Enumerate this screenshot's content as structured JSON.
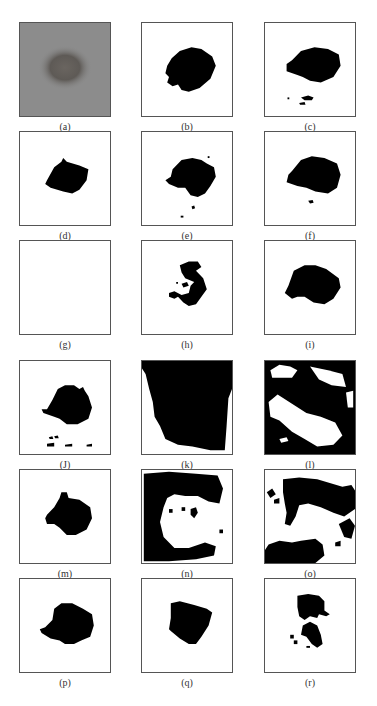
{
  "figure": {
    "colors": {
      "frame": "#555555",
      "mask": "#000000",
      "background": "#ffffff",
      "photo_bg": "#8c8c8c",
      "lesion": "#5e5a56"
    },
    "columns_x": [
      19,
      141,
      264
    ],
    "rows_y": [
      22,
      131,
      240,
      360,
      469,
      578
    ],
    "panels": [
      {
        "id": "a",
        "label": "(a)",
        "type": "photo",
        "col": 0,
        "row": 0
      },
      {
        "id": "b",
        "label": "(b)",
        "type": "mask",
        "col": 1,
        "row": 0,
        "paths": [
          "M33 38 L42 30 L55 26 L66 28 L78 36 L82 46 L76 60 L64 70 L52 74 L44 72 L40 66 L34 68 L28 64 L30 58 L26 54 L28 46 Z"
        ]
      },
      {
        "id": "c",
        "label": "(c)",
        "type": "mask",
        "col": 2,
        "row": 0,
        "paths": [
          "M30 40 L40 30 L55 26 L70 28 L82 34 L84 46 L76 58 L62 64 L50 62 L42 58 L36 56 L24 52 L24 44 Z",
          "M40 80 L48 78 L54 80 L52 83 L44 83 Z",
          "M38 86 L44 85 L45 88 L39 88 Z",
          "M25 80 L27 80 L27 82 L25 82 Z"
        ]
      },
      {
        "id": "d",
        "label": "(d)",
        "type": "mask",
        "col": 0,
        "row": 1,
        "paths": [
          "M30 52 L38 38 L46 32 L48 28 L52 32 L66 36 L76 40 L74 52 L66 62 L58 66 L48 64 L34 60 L28 56 Z"
        ]
      },
      {
        "id": "e",
        "label": "(e)",
        "type": "mask",
        "col": 1,
        "row": 1,
        "paths": [
          "M34 40 L44 30 L56 28 L66 30 L72 34 L80 38 L82 48 L76 58 L70 66 L62 70 L54 68 L48 60 L40 60 L30 56 L26 52 L32 48 Z",
          "M55 80 L58 79 L59 82 L56 83 Z",
          "M43 90 L46 90 L46 92 L43 92 Z",
          "M73 26 L75 26 L75 28 L73 28 Z"
        ]
      },
      {
        "id": "f",
        "label": "(f)",
        "type": "mask",
        "col": 2,
        "row": 1,
        "paths": [
          "M30 42 L40 30 L52 26 L66 28 L80 34 L84 46 L80 60 L70 66 L56 64 L46 60 L36 58 L24 54 L26 46 Z",
          "M48 74 L53 73 L54 76 L50 77 Z"
        ]
      },
      {
        "id": "g",
        "label": "(g)",
        "type": "mask",
        "col": 0,
        "row": 2,
        "paths": []
      },
      {
        "id": "h",
        "label": "(h)",
        "type": "mask",
        "col": 1,
        "row": 2,
        "paths": [
          "M42 26 L52 22 L62 22 L66 28 L60 32 L68 40 L72 52 L66 60 L60 68 L52 70 L46 66 L40 60 L36 62 L30 60 L30 56 L36 54 L44 58 L52 56 L54 48 L58 44 L48 40 L44 34 Z",
          "M44 46 L50 44 L52 48 L46 50 Z",
          "M38 44 L40 44 L40 46 L38 46 Z"
        ]
      },
      {
        "id": "i",
        "label": "(i)",
        "type": "mask",
        "col": 2,
        "row": 2,
        "paths": [
          "M26 48 L32 32 L44 26 L56 26 L68 30 L82 40 L84 50 L76 62 L66 68 L54 66 L44 60 L36 60 L30 62 L22 56 Z"
        ]
      },
      {
        "id": "J",
        "label": "(J)",
        "type": "mask",
        "col": 0,
        "row": 3,
        "paths": [
          "M30 52 L36 42 L42 30 L50 26 L60 26 L66 30 L70 28 L72 32 L76 38 L80 50 L76 62 L64 68 L52 68 L44 62 L38 60 L26 56 L24 52 Z",
          "M32 82 L36 81 L37 84 L33 84 Z",
          "M38 81 L42 80 L43 83 L39 83 Z",
          "M30 89 L38 88 L38 92 L30 92 Z",
          "M50 90 L58 89 L58 92 L50 92 Z",
          "M74 90 L80 89 L80 92 L74 92 Z"
        ]
      },
      {
        "id": "k",
        "label": "(k)",
        "type": "mask",
        "col": 1,
        "row": 3,
        "paths": [
          "M0 0 L100 0 L100 30 L96 40 L94 70 L92 96 L76 96 L56 92 L40 90 L26 84 L20 70 L14 60 L12 44 L8 30 L4 14 L0 8 Z",
          "M34 20 L56 22 L70 24 L74 28 L56 30 L40 28 L30 26 Z"
        ]
      },
      {
        "id": "l",
        "label": "(l)",
        "type": "mask",
        "col": 2,
        "row": 3,
        "paths": [
          "M0 0 L100 0 L100 100 L0 100 Z"
        ],
        "holes": [
          "M6 10 L16 4 L28 6 L36 10 L30 18 L18 18 L8 18 Z",
          "M4 44 L14 36 L30 46 L46 56 L62 60 L78 66 L86 80 L76 90 L58 92 L44 84 L30 76 L16 64 L6 60 Z",
          "M50 6 L70 10 L86 14 L90 28 L74 26 L60 20 Z",
          "M16 84 L24 82 L26 86 L18 88 Z",
          "M90 34 L98 32 L98 50 L92 50 Z"
        ]
      },
      {
        "id": "m",
        "label": "(m)",
        "type": "mask",
        "col": 0,
        "row": 4,
        "paths": [
          "M30 48 L38 40 L44 30 L46 24 L52 24 L54 30 L66 32 L78 40 L80 52 L74 64 L62 70 L52 70 L44 62 L38 58 L30 58 L28 52 Z"
        ]
      },
      {
        "id": "n",
        "label": "(n)",
        "type": "mask",
        "col": 1,
        "row": 4,
        "paths": [
          "M2 4 L30 2 L60 4 L84 6 L90 20 L86 36 L74 34 L62 28 L48 28 L36 26 L28 30 L24 40 L20 56 L24 72 L36 84 L52 84 L70 78 L82 82 L80 92 L60 96 L30 98 L2 98 Z",
          "M54 42 L60 40 L62 46 L58 52 L54 48 Z",
          "M44 40 L48 40 L48 44 L44 44 Z",
          "M30 42 L34 42 L34 46 L30 46 Z",
          "M86 64 L90 64 L90 68 L86 68 Z"
        ]
      },
      {
        "id": "o",
        "label": "(o)",
        "type": "mask",
        "col": 2,
        "row": 4,
        "paths": [
          "M20 10 L38 8 L58 10 L72 14 L86 18 L96 16 L100 22 L100 42 L88 50 L76 46 L62 40 L48 36 L38 38 L34 50 L28 60 L22 58 L24 46 L22 36 L20 24 Z",
          "M2 24 L8 20 L12 26 L6 30 Z",
          "M10 32 L16 30 L16 36 L10 36 Z",
          "M82 58 L94 52 L100 60 L96 74 L88 72 Z",
          "M78 78 L84 76 L84 82 L78 82 Z",
          "M4 80 L16 76 L30 78 L40 76 L56 74 L64 80 L66 92 L56 100 L0 100 L0 86 Z"
        ]
      },
      {
        "id": "p",
        "label": "(p)",
        "type": "mask",
        "col": 0,
        "row": 5,
        "paths": [
          "M28 52 L36 44 L38 32 L46 26 L58 26 L70 32 L80 38 L82 50 L78 62 L68 66 L60 70 L50 70 L44 66 L34 64 L24 58 L22 54 Z"
        ]
      },
      {
        "id": "q",
        "label": "(q)",
        "type": "mask",
        "col": 1,
        "row": 5,
        "paths": [
          "M32 26 L42 24 L58 28 L72 32 L78 36 L74 50 L66 62 L60 70 L52 70 L42 64 L32 56 L30 54 L32 42 Z"
        ]
      },
      {
        "id": "r",
        "label": "(r)",
        "type": "mask",
        "col": 2,
        "row": 5,
        "paths": [
          "M36 18 L48 16 L60 18 L66 24 L66 34 L72 38 L68 40 L60 38 L58 42 L50 40 L44 44 L38 40 L36 30 Z",
          "M42 50 L50 46 L58 50 L62 60 L64 70 L58 74 L52 70 L46 62 L40 60 Z",
          "M28 60 L32 60 L32 64 L28 64 Z",
          "M32 66 L36 66 L36 70 L32 70 Z",
          "M46 72 L50 72 L50 74 L46 74 Z"
        ]
      }
    ]
  }
}
